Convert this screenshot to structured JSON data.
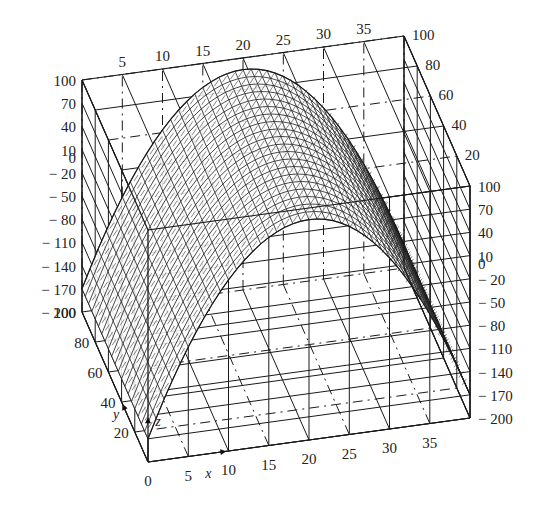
{
  "chart_data": {
    "type": "surface3d",
    "title": "",
    "axes": {
      "x": {
        "label": "x",
        "range": [
          0,
          40
        ],
        "ticks": [
          0,
          5,
          10,
          15,
          20,
          25,
          30,
          35
        ]
      },
      "y": {
        "label": "y",
        "range": [
          0,
          100
        ],
        "ticks": [
          20,
          40,
          60,
          80,
          100
        ]
      },
      "z": {
        "label": "z",
        "range": [
          -200,
          100
        ],
        "ticks": [
          100,
          70,
          40,
          10,
          0,
          -20,
          -50,
          -80,
          -110,
          -140,
          -170,
          -200
        ]
      }
    },
    "tick_labels": {
      "x_top": [
        "5",
        "10",
        "15",
        "20",
        "25",
        "30",
        "35"
      ],
      "x_bottom": [
        "0",
        "5",
        "10",
        "15",
        "20",
        "25",
        "30",
        "35"
      ],
      "y_right_top": [
        "100",
        "80",
        "60",
        "40",
        "20"
      ],
      "y_left_bottom": [
        "100",
        "80",
        "60",
        "40",
        "20"
      ],
      "z_left": [
        "100",
        "70",
        "40",
        "10",
        "0",
        "-20",
        "-50",
        "-80",
        "-110",
        "-140",
        "-170",
        "-200"
      ],
      "z_right": [
        "100",
        "70",
        "40",
        "10",
        "0",
        "-20",
        "-50",
        "-80",
        "-110",
        "-140",
        "-170",
        "-200"
      ]
    },
    "surface": {
      "shape": "parabolic arch",
      "peak": {
        "x": 20,
        "z": 85
      },
      "ends": [
        {
          "x": 0,
          "z": -170
        },
        {
          "x": 40,
          "z": -170
        }
      ],
      "y_extent": [
        0,
        100
      ]
    },
    "grid": true,
    "legend": null
  },
  "labels": {
    "x_axis": "x",
    "y_axis": "y",
    "z_axis": "z"
  }
}
